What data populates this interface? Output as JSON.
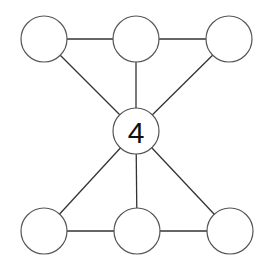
{
  "diagram": {
    "type": "graph",
    "nodes": [
      {
        "id": "top-left",
        "label": ""
      },
      {
        "id": "top-middle",
        "label": ""
      },
      {
        "id": "top-right",
        "label": ""
      },
      {
        "id": "center",
        "label": "4"
      },
      {
        "id": "bottom-left",
        "label": ""
      },
      {
        "id": "bottom-middle",
        "label": ""
      },
      {
        "id": "bottom-right",
        "label": ""
      }
    ],
    "edges": [
      [
        "top-left",
        "top-middle"
      ],
      [
        "top-middle",
        "top-right"
      ],
      [
        "top-left",
        "center"
      ],
      [
        "top-middle",
        "center"
      ],
      [
        "top-right",
        "center"
      ],
      [
        "center",
        "bottom-left"
      ],
      [
        "center",
        "bottom-middle"
      ],
      [
        "center",
        "bottom-right"
      ],
      [
        "bottom-left",
        "bottom-middle"
      ],
      [
        "bottom-middle",
        "bottom-right"
      ]
    ]
  }
}
